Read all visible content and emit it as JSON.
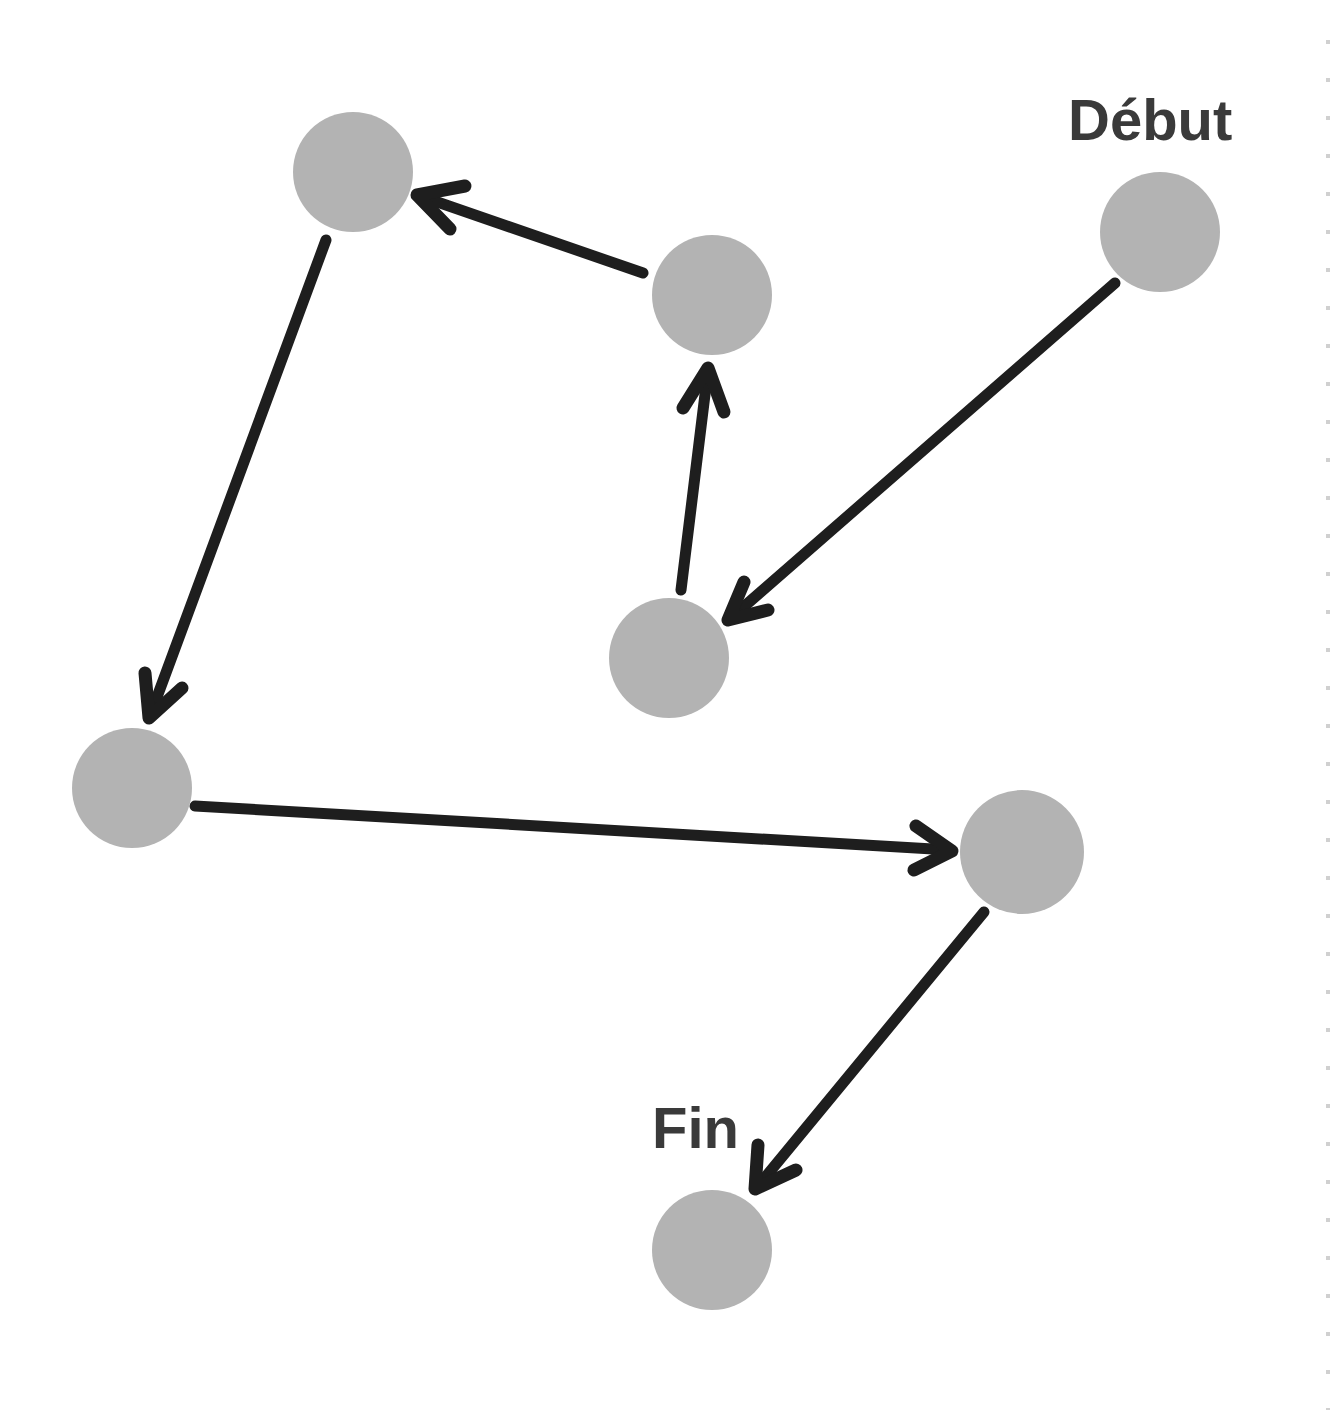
{
  "diagram": {
    "type": "directed-graph",
    "labels": {
      "start": "Début",
      "end": "Fin"
    },
    "colors": {
      "node": "#b3b3b3",
      "edge": "#1e1e1e",
      "label": "#3a3a3a",
      "background": "#ffffff"
    },
    "nodes": [
      {
        "id": "n1",
        "cx": 353,
        "cy": 172,
        "r": 60
      },
      {
        "id": "n2",
        "cx": 712,
        "cy": 295,
        "r": 60
      },
      {
        "id": "start",
        "cx": 1160,
        "cy": 232,
        "r": 60,
        "label": "Début"
      },
      {
        "id": "n4",
        "cx": 669,
        "cy": 658,
        "r": 60
      },
      {
        "id": "n5",
        "cx": 132,
        "cy": 788,
        "r": 60
      },
      {
        "id": "n6",
        "cx": 1022,
        "cy": 852,
        "r": 62
      },
      {
        "id": "end",
        "cx": 712,
        "cy": 1250,
        "r": 60,
        "label": "Fin"
      }
    ],
    "edges": [
      {
        "from": "start",
        "to": "n4"
      },
      {
        "from": "n4",
        "to": "n2"
      },
      {
        "from": "n2",
        "to": "n1"
      },
      {
        "from": "n1",
        "to": "n5"
      },
      {
        "from": "n5",
        "to": "n6"
      },
      {
        "from": "n6",
        "to": "end"
      }
    ]
  }
}
